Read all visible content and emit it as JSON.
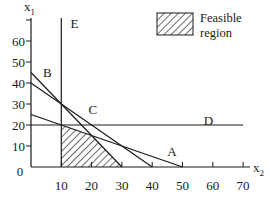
{
  "chart_data": {
    "type": "line",
    "title": "",
    "xlabel": "x2",
    "ylabel": "x1",
    "xlim": [
      0,
      70
    ],
    "ylim": [
      0,
      70
    ],
    "x_ticks": [
      10,
      20,
      30,
      40,
      50,
      60,
      70
    ],
    "y_ticks": [
      10,
      20,
      30,
      40,
      50,
      60
    ],
    "origin_label": "0",
    "grid": false,
    "legend": {
      "position": "top-right",
      "entries": [
        {
          "label_line1": "Feasible",
          "label_line2": "region",
          "style": "hatched"
        }
      ]
    },
    "series": [
      {
        "name": "A",
        "points": [
          [
            0,
            25
          ],
          [
            50,
            0
          ]
        ],
        "label_at": [
          45,
          7
        ]
      },
      {
        "name": "B",
        "points": [
          [
            0,
            45
          ],
          [
            30,
            0
          ]
        ],
        "label_at": [
          4,
          45
        ]
      },
      {
        "name": "C",
        "points": [
          [
            0,
            40
          ],
          [
            40,
            0
          ]
        ],
        "label_at": [
          19,
          27
        ]
      },
      {
        "name": "D",
        "points": [
          [
            0,
            20
          ],
          [
            70,
            20
          ]
        ],
        "label_at": [
          57,
          22
        ]
      },
      {
        "name": "E",
        "points": [
          [
            10,
            0
          ],
          [
            10,
            75
          ]
        ],
        "label_at": [
          13,
          68
        ]
      }
    ],
    "feasible_region": {
      "vertices": [
        [
          10,
          0
        ],
        [
          10,
          20
        ],
        [
          20,
          15
        ],
        [
          30,
          0
        ]
      ],
      "fill": "hatched"
    }
  },
  "axes": {
    "x_label": "x",
    "x_sub": "2",
    "y_label": "x",
    "y_sub": "1"
  },
  "colors": {
    "ink": "#1a1a1a",
    "background": "#ffffff"
  }
}
